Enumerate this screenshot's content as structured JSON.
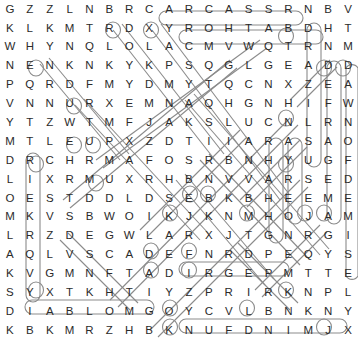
{
  "puzzle": {
    "title": "Word Search Grid",
    "type": "word-search",
    "rows": 18,
    "cols": 18,
    "cell_size": 19.3,
    "origin_x": 31,
    "origin_y": 17,
    "ink_color": "#2b2b2b",
    "mark_color": "#8b8b8b",
    "background": "#ffffff",
    "grid": [
      [
        "G",
        "Z",
        "Z",
        "L",
        "N",
        "B",
        "R",
        "C",
        "A",
        "R",
        "C",
        "A",
        "S",
        "S",
        "R",
        "N",
        "B",
        "V"
      ],
      [
        "K",
        "L",
        "K",
        "M",
        "T",
        "R",
        "D",
        "X",
        "Y",
        "R",
        "O",
        "H",
        "T",
        "A",
        "B",
        "D",
        "H",
        "T"
      ],
      [
        "W",
        "H",
        "Y",
        "N",
        "Q",
        "L",
        "O",
        "L",
        "A",
        "C",
        "M",
        "V",
        "W",
        "Q",
        "T",
        "R",
        "N",
        "M"
      ],
      [
        "N",
        "E",
        "N",
        "K",
        "N",
        "K",
        "Y",
        "K",
        "P",
        "S",
        "Q",
        "G",
        "L",
        "G",
        "E",
        "A",
        "D",
        "D"
      ],
      [
        "P",
        "Q",
        "R",
        "D",
        "F",
        "M",
        "Y",
        "D",
        "M",
        "Y",
        "T",
        "Q",
        "C",
        "N",
        "X",
        "Z",
        "E",
        "A"
      ],
      [
        "V",
        "N",
        "N",
        "U",
        "R",
        "X",
        "E",
        "M",
        "N",
        "A",
        "Q",
        "H",
        "G",
        "N",
        "H",
        "I",
        "F",
        "W"
      ],
      [
        "Y",
        "T",
        "Z",
        "W",
        "T",
        "M",
        "F",
        "J",
        "A",
        "K",
        "S",
        "L",
        "U",
        "C",
        "N",
        "L",
        "R",
        "N"
      ],
      [
        "M",
        "T",
        "L",
        "E",
        "U",
        "P",
        "X",
        "Z",
        "D",
        "T",
        "I",
        "I",
        "A",
        "R",
        "A",
        "S",
        "A",
        "O"
      ],
      [
        "D",
        "R",
        "C",
        "H",
        "R",
        "M",
        "A",
        "F",
        "O",
        "S",
        "R",
        "B",
        "N",
        "H",
        "Y",
        "U",
        "G",
        "F"
      ],
      [
        "L",
        "I",
        "X",
        "R",
        "M",
        "U",
        "X",
        "R",
        "H",
        "B",
        "N",
        "V",
        "V",
        "A",
        "R",
        "S",
        "E",
        "D"
      ],
      [
        "O",
        "E",
        "S",
        "T",
        "D",
        "D",
        "L",
        "D",
        "S",
        "E",
        "B",
        "K",
        "B",
        "H",
        "E",
        "E",
        "M",
        "E"
      ],
      [
        "M",
        "K",
        "V",
        "S",
        "B",
        "W",
        "O",
        "I",
        "K",
        "J",
        "K",
        "N",
        "M",
        "H",
        "O",
        "J",
        "A",
        "M"
      ],
      [
        "L",
        "R",
        "Z",
        "D",
        "E",
        "G",
        "W",
        "L",
        "A",
        "R",
        "X",
        "J",
        "T",
        "G",
        "N",
        "R",
        "G",
        "I"
      ],
      [
        "A",
        "Q",
        "L",
        "V",
        "S",
        "C",
        "A",
        "D",
        "E",
        "F",
        "N",
        "R",
        "D",
        "P",
        "E",
        "Q",
        "Y",
        "S"
      ],
      [
        "K",
        "V",
        "G",
        "M",
        "N",
        "F",
        "T",
        "A",
        "D",
        "I",
        "R",
        "G",
        "E",
        "P",
        "M",
        "T",
        "T",
        "E"
      ],
      [
        "S",
        "Y",
        "X",
        "T",
        "K",
        "H",
        "T",
        "I",
        "Y",
        "Z",
        "P",
        "R",
        "I",
        "R",
        "K",
        "N",
        "P",
        "L"
      ],
      [
        "D",
        "I",
        "A",
        "B",
        "L",
        "O",
        "M",
        "G",
        "O",
        "Y",
        "C",
        "V",
        "L",
        "B",
        "N",
        "K",
        "N",
        "Y"
      ],
      [
        "K",
        "B",
        "K",
        "M",
        "R",
        "Z",
        "H",
        "B",
        "K",
        "N",
        "U",
        "F",
        "D",
        "N",
        "I",
        "M",
        "J",
        "X"
      ]
    ],
    "found_words": [
      {
        "text": "CARCASS",
        "start_row": 0,
        "start_col": 7,
        "direction": "horizontal-right",
        "length": 7
      },
      {
        "text": "BATHORY",
        "start_row": 1,
        "start_col": 14,
        "direction": "horizontal-left",
        "length": 7
      },
      {
        "text": "DIABLO",
        "start_row": 16,
        "start_col": 0,
        "direction": "horizontal-right",
        "length": 6
      },
      {
        "text": "DIRGE",
        "start_row": 14,
        "start_col": 8,
        "direction": "horizontal-right",
        "length": 5
      },
      {
        "text": "KNUFDNIM",
        "start_row": 17,
        "start_col": 8,
        "direction": "horizontal-right",
        "length": 8
      },
      {
        "text": "DRAMKSY",
        "start_row": 1,
        "start_col": 15,
        "direction": "vertical-down",
        "length": 4
      },
      {
        "text": "DEFRAG",
        "start_row": 3,
        "start_col": 16,
        "direction": "vertical-down",
        "length": 5
      },
      {
        "text": "DAWNOF",
        "start_row": 3,
        "start_col": 17,
        "direction": "vertical-down",
        "length": 6
      },
      {
        "text": "ENEMY",
        "start_row": 3,
        "start_col": 1,
        "direction": "diagonal-down-right",
        "length": 3
      },
      {
        "text": "EUPHORIA",
        "start_row": 7,
        "start_col": 3,
        "direction": "diagonal",
        "length": 4
      },
      {
        "text": "DLOMKS",
        "start_row": 8,
        "start_col": 0,
        "direction": "vertical-down",
        "length": 8
      },
      {
        "text": "AZSLRN",
        "start_row": 6,
        "start_col": 15,
        "direction": "vertical-down",
        "length": 6
      },
      {
        "text": "ARAS",
        "start_row": 7,
        "start_col": 14,
        "direction": "vertical-down",
        "length": 5
      }
    ]
  }
}
